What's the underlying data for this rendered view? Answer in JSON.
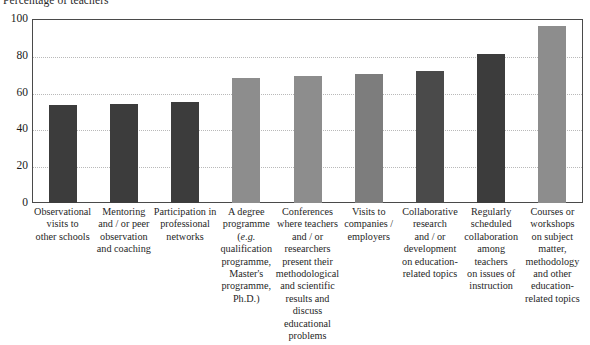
{
  "chart_data": {
    "type": "bar",
    "title": "Percentage of teachers",
    "xlabel": "",
    "ylabel": "",
    "ylim": [
      0,
      100
    ],
    "yticks": [
      0,
      20,
      40,
      60,
      80,
      100
    ],
    "grid": true,
    "legend": "none",
    "categories": [
      "Observational visits to other schools",
      "Mentoring and / or peer observation and coaching",
      "Participation in professional networks",
      "A degree programme (e.g. qualification programme, Master's programme, Ph.D.)",
      "Conferences where teachers and / or researchers present their methodological and scientific results and discuss educational problems",
      "Visits to companies / employers",
      "Collaborative research and / or development on education-related topics",
      "Regularly scheduled collaboration among teachers on issues of instruction",
      "Courses or workshops on subject matter, methodology and other education-related topics"
    ],
    "category_lines": [
      [
        "Observational",
        "visits to",
        "other schools"
      ],
      [
        "Mentoring",
        "and / or peer",
        "observation",
        "and coaching"
      ],
      [
        "Participation in",
        "professional",
        "networks"
      ],
      [
        "A degree",
        "programme",
        "(e.g.",
        "qualification",
        "programme,",
        "Master's",
        "programme,",
        "Ph.D.)"
      ],
      [
        "Conferences",
        "where teachers",
        "and / or",
        "researchers",
        "present their",
        "methodological",
        "and scientific",
        "results and",
        "discuss",
        "educational",
        "problems"
      ],
      [
        "Visits to",
        "companies /",
        "employers"
      ],
      [
        "Collaborative",
        "research",
        "and / or",
        "development",
        "on education-",
        "related topics"
      ],
      [
        "Regularly",
        "scheduled",
        "collaboration",
        "among",
        "teachers",
        "on issues of",
        "instruction"
      ],
      [
        "Courses or",
        "workshops",
        "on subject",
        "matter,",
        "methodology",
        "and other",
        "education-",
        "related topics"
      ]
    ],
    "values": [
      53,
      54,
      55,
      68,
      69,
      70,
      72,
      81,
      96
    ],
    "bar_colors": [
      "#3c3c3c",
      "#3c3c3c",
      "#3c3c3c",
      "#8d8d8d",
      "#8d8d8d",
      "#7d7d7d",
      "#4a4a4a",
      "#3c3c3c",
      "#8d8d8d"
    ],
    "axis_color": "#4a4a4a",
    "grid_color": "#b9b9b9"
  }
}
